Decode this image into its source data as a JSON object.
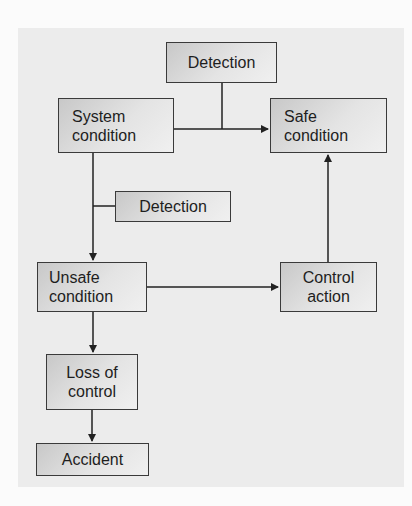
{
  "diagram": {
    "type": "flowchart",
    "nodes": [
      {
        "id": "detection_top",
        "lines": [
          "Detection"
        ]
      },
      {
        "id": "system_condition",
        "lines": [
          "System",
          "condition"
        ]
      },
      {
        "id": "safe_condition",
        "lines": [
          "Safe",
          "condition"
        ]
      },
      {
        "id": "detection_mid",
        "lines": [
          "Detection"
        ]
      },
      {
        "id": "unsafe_condition",
        "lines": [
          "Unsafe",
          "condition"
        ]
      },
      {
        "id": "control_action",
        "lines": [
          "Control",
          "action"
        ]
      },
      {
        "id": "loss_of_control",
        "lines": [
          "Loss of",
          "control"
        ]
      },
      {
        "id": "accident",
        "lines": [
          "Accident"
        ]
      }
    ],
    "edges": [
      {
        "from": "system_condition",
        "to": "safe_condition",
        "via": "detection_top"
      },
      {
        "from": "system_condition",
        "to": "unsafe_condition",
        "via": "detection_mid"
      },
      {
        "from": "unsafe_condition",
        "to": "control_action"
      },
      {
        "from": "control_action",
        "to": "safe_condition"
      },
      {
        "from": "unsafe_condition",
        "to": "loss_of_control"
      },
      {
        "from": "loss_of_control",
        "to": "accident"
      }
    ],
    "colors": {
      "background": "#ececec",
      "box_border": "#3a3a3a",
      "box_fill_dark": "#c8c8c8",
      "box_fill_light": "#f0f0f0",
      "line": "#222222"
    }
  }
}
